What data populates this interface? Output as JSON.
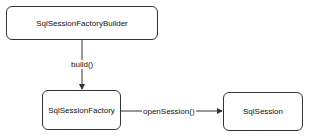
{
  "diagram": {
    "type": "flow",
    "nodes": [
      {
        "id": "builder",
        "label": "SqlSessionFactoryBuilder"
      },
      {
        "id": "factory",
        "label": "SqlSessionFactory"
      },
      {
        "id": "session",
        "label": "SqlSession"
      }
    ],
    "edges": [
      {
        "from": "builder",
        "to": "factory",
        "label": "build()"
      },
      {
        "from": "factory",
        "to": "session",
        "label": "openSession()"
      }
    ],
    "colors": {
      "stroke": "#333333",
      "fill": "#ffffff",
      "text": "#111111"
    }
  }
}
